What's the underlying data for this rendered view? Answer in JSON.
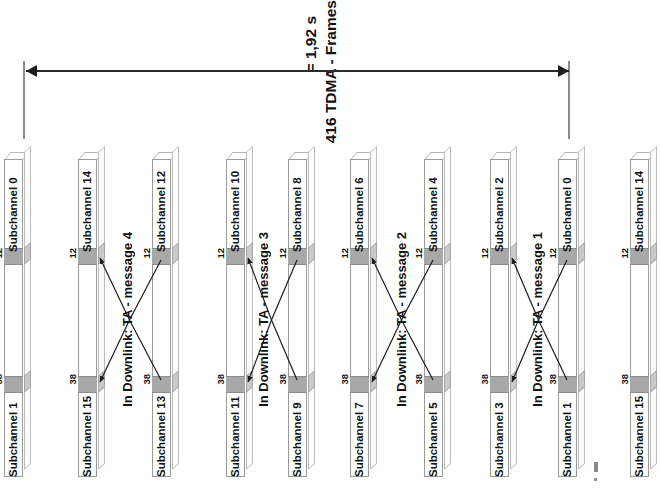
{
  "diagram": {
    "title_line1": "416 TDMA - Frames",
    "title_line2": "= 1,92 s",
    "dimension_label": "416 TDMA - Frames = 1,92 s",
    "band_label_top": "12",
    "band_label_bottom": "38",
    "bars": [
      {
        "x": 4,
        "top_label": "Subchannel 0",
        "bottom_label": "Subchannel 1",
        "band_top": "12",
        "band_bottom": "38",
        "has_arrows": false
      },
      {
        "x": 78,
        "top_label": "Subchannel 14",
        "bottom_label": "Subchannel 15",
        "band_top": "12",
        "band_bottom": "38",
        "has_arrows": true
      },
      {
        "x": 152,
        "top_label": "Subchannel 12",
        "bottom_label": "Subchannel 13",
        "band_top": "12",
        "band_bottom": "38",
        "has_arrows": true
      },
      {
        "x": 226,
        "top_label": "Subchannel 10",
        "bottom_label": "Subchannel 11",
        "band_top": "12",
        "band_bottom": "38",
        "has_arrows": true
      },
      {
        "x": 288,
        "top_label": "Subchannel 8",
        "bottom_label": "Subchannel 9",
        "band_top": "12",
        "band_bottom": "38",
        "has_arrows": true
      },
      {
        "x": 350,
        "top_label": "Subchannel 6",
        "bottom_label": "Subchannel 7",
        "band_top": "12",
        "band_bottom": "38",
        "has_arrows": true
      },
      {
        "x": 424,
        "top_label": "Subchannel 4",
        "bottom_label": "Subchannel 5",
        "band_top": "12",
        "band_bottom": "38",
        "has_arrows": true
      },
      {
        "x": 490,
        "top_label": "Subchannel 2",
        "bottom_label": "Subchannel 3",
        "band_top": "12",
        "band_bottom": "38",
        "has_arrows": true
      },
      {
        "x": 558,
        "top_label": "Subchannel 0",
        "bottom_label": "Subchannel 1",
        "band_top": "12",
        "band_bottom": "38",
        "has_arrows": true
      },
      {
        "x": 630,
        "top_label": "Subchannel 14",
        "bottom_label": "Subchannel 15",
        "band_top": "12",
        "band_bottom": "38",
        "has_arrows": false
      }
    ],
    "messages": [
      {
        "x": 120,
        "label": "In Downlink: TA - message 4"
      },
      {
        "x": 256,
        "label": "In Downlink: TA - message 3"
      },
      {
        "x": 394,
        "label": "In Downlink: TA - message 2"
      },
      {
        "x": 530,
        "label": "In Downlink: TA - message 1"
      }
    ]
  }
}
